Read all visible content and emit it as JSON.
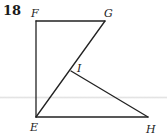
{
  "problem": {
    "number": "18"
  },
  "figure": {
    "vertices": [
      {
        "id": "F",
        "label": "F",
        "x": 36,
        "y": 21
      },
      {
        "id": "G",
        "label": "G",
        "x": 105,
        "y": 21
      },
      {
        "id": "I",
        "label": "I",
        "x": 71,
        "y": 71
      },
      {
        "id": "E",
        "label": "E",
        "x": 36,
        "y": 117
      },
      {
        "id": "H",
        "label": "H",
        "x": 148,
        "y": 117
      }
    ],
    "segments": [
      {
        "from": "F",
        "to": "G"
      },
      {
        "from": "F",
        "to": "E"
      },
      {
        "from": "G",
        "to": "E"
      },
      {
        "from": "I",
        "to": "H"
      },
      {
        "from": "E",
        "to": "H"
      }
    ],
    "labels": {
      "F": "F",
      "G": "G",
      "I": "I",
      "E": "E",
      "H": "H"
    },
    "line_color": "#222222"
  }
}
